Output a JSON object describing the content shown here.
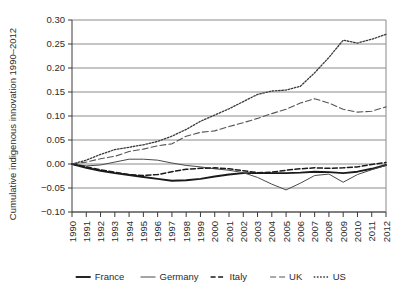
{
  "chart_data": {
    "type": "line",
    "title": "",
    "xlabel": "",
    "ylabel": "Cumulative indigenous innovation 1990–2012",
    "xlim": [
      1990,
      2012
    ],
    "ylim": [
      -0.1,
      0.3
    ],
    "ytick_labels": [
      "0.30",
      "0.25",
      "0.20",
      "0.15",
      "0.10",
      "0.05",
      "0.00",
      "−0.05",
      "−0.10"
    ],
    "ytick_values": [
      0.3,
      0.25,
      0.2,
      0.15,
      0.1,
      0.05,
      0.0,
      -0.05,
      -0.1
    ],
    "x": [
      1990,
      1991,
      1992,
      1993,
      1994,
      1995,
      1996,
      1997,
      1998,
      1999,
      2000,
      2001,
      2002,
      2003,
      2004,
      2005,
      2006,
      2007,
      2008,
      2009,
      2010,
      2011,
      2012
    ],
    "xtick_labels": [
      "1990",
      "1991",
      "1992",
      "1993",
      "1994",
      "1995",
      "1996",
      "1997",
      "1998",
      "1999",
      "2000",
      "2001",
      "2002",
      "2003",
      "2004",
      "2005",
      "2006",
      "2007",
      "2008",
      "2009",
      "2010",
      "2011",
      "2012"
    ],
    "grid": "horizontal",
    "legend_position": "bottom",
    "series": [
      {
        "name": "France",
        "style": "solid-thick",
        "color": "#1a1a1a",
        "values": [
          0.0,
          -0.008,
          -0.014,
          -0.019,
          -0.023,
          -0.027,
          -0.031,
          -0.035,
          -0.034,
          -0.031,
          -0.026,
          -0.022,
          -0.019,
          -0.019,
          -0.019,
          -0.019,
          -0.018,
          -0.016,
          -0.017,
          -0.019,
          -0.016,
          -0.01,
          -0.002
        ]
      },
      {
        "name": "Germany",
        "style": "solid-thin",
        "color": "#4a4a4a",
        "values": [
          0.0,
          -0.004,
          -0.002,
          0.004,
          0.01,
          0.01,
          0.008,
          0.002,
          -0.003,
          -0.006,
          -0.01,
          -0.013,
          -0.018,
          -0.028,
          -0.042,
          -0.054,
          -0.04,
          -0.024,
          -0.021,
          -0.038,
          -0.022,
          -0.012,
          -0.003
        ]
      },
      {
        "name": "Italy",
        "style": "dash-dot",
        "color": "#1a1a1a",
        "values": [
          0.0,
          -0.006,
          -0.012,
          -0.017,
          -0.022,
          -0.024,
          -0.022,
          -0.016,
          -0.011,
          -0.009,
          -0.008,
          -0.01,
          -0.014,
          -0.018,
          -0.017,
          -0.013,
          -0.01,
          -0.008,
          -0.009,
          -0.008,
          -0.006,
          -0.001,
          0.003
        ]
      },
      {
        "name": "UK",
        "style": "dashed",
        "color": "#555555",
        "values": [
          0.0,
          0.004,
          0.011,
          0.016,
          0.026,
          0.031,
          0.038,
          0.042,
          0.058,
          0.066,
          0.069,
          0.078,
          0.086,
          0.095,
          0.105,
          0.114,
          0.127,
          0.136,
          0.127,
          0.114,
          0.108,
          0.11,
          0.119
        ]
      },
      {
        "name": "US",
        "style": "dotted",
        "color": "#3a3a3a",
        "values": [
          0.0,
          0.008,
          0.02,
          0.03,
          0.035,
          0.04,
          0.047,
          0.058,
          0.072,
          0.089,
          0.102,
          0.115,
          0.13,
          0.145,
          0.152,
          0.154,
          0.162,
          0.19,
          0.222,
          0.258,
          0.252,
          0.26,
          0.27
        ]
      }
    ]
  },
  "legend": {
    "items": [
      {
        "label": "France",
        "style": "solid-thick"
      },
      {
        "label": "Germany",
        "style": "solid-thin"
      },
      {
        "label": "Italy",
        "style": "dash-dot"
      },
      {
        "label": "UK",
        "style": "dashed"
      },
      {
        "label": "US",
        "style": "dotted"
      }
    ]
  }
}
